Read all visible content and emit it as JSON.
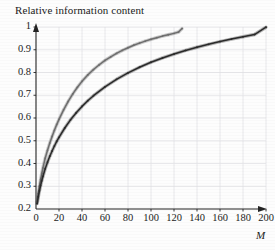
{
  "chart_data": {
    "type": "line",
    "title": "Relative information content",
    "xlabel": "M",
    "ylabel": "",
    "xlim": [
      0,
      200
    ],
    "ylim": [
      0.2,
      1
    ],
    "grid": true,
    "legend": "none",
    "xticks": [
      "0",
      "20",
      "40",
      "60",
      "80",
      "100",
      "120",
      "140",
      "160",
      "180",
      "200"
    ],
    "yticks": [
      "0.2",
      "0.3",
      "0.4",
      "0.5",
      "0.6",
      "0.7",
      "0.8",
      "0.9",
      "1"
    ],
    "series": [
      {
        "name": "upper-curve",
        "color": "#6e6e6e",
        "style": "dotted-thick",
        "x": [
          1,
          2,
          3,
          4,
          5,
          6,
          8,
          10,
          12,
          14,
          16,
          18,
          20,
          24,
          28,
          32,
          36,
          40,
          45,
          50,
          55,
          60,
          65,
          70,
          75,
          80,
          85,
          90,
          95,
          100,
          105,
          110,
          115,
          120,
          124,
          127
        ],
        "y": [
          0.232,
          0.268,
          0.3,
          0.33,
          0.357,
          0.381,
          0.423,
          0.458,
          0.49,
          0.519,
          0.546,
          0.571,
          0.594,
          0.636,
          0.673,
          0.706,
          0.735,
          0.761,
          0.789,
          0.813,
          0.834,
          0.853,
          0.869,
          0.884,
          0.897,
          0.909,
          0.92,
          0.929,
          0.938,
          0.946,
          0.953,
          0.96,
          0.966,
          0.972,
          0.978,
          0.993
        ]
      },
      {
        "name": "lower-curve",
        "color": "#2a2a2a",
        "style": "dotted-thick",
        "x": [
          1,
          2,
          3,
          4,
          5,
          6,
          8,
          10,
          12,
          14,
          16,
          18,
          20,
          25,
          30,
          35,
          40,
          45,
          50,
          60,
          70,
          80,
          90,
          100,
          110,
          120,
          130,
          140,
          150,
          160,
          170,
          180,
          190,
          200
        ],
        "y": [
          0.224,
          0.254,
          0.28,
          0.303,
          0.324,
          0.343,
          0.377,
          0.406,
          0.432,
          0.455,
          0.477,
          0.497,
          0.515,
          0.556,
          0.592,
          0.623,
          0.651,
          0.676,
          0.698,
          0.737,
          0.77,
          0.798,
          0.823,
          0.845,
          0.864,
          0.881,
          0.897,
          0.911,
          0.924,
          0.936,
          0.947,
          0.957,
          0.967,
          0.999
        ]
      }
    ]
  }
}
